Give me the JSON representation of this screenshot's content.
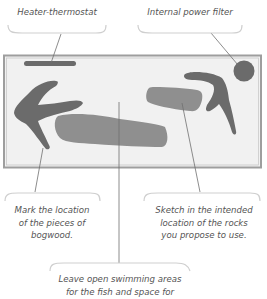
{
  "diagram": {
    "colors": {
      "tank_frame": "#9e9e9e",
      "tank_fill": "#f1f1f1",
      "bogwood": "#6b6b6b",
      "rock": "#8f8f8f",
      "heater": "#6b6b6b",
      "filter": "#6b6b6b",
      "leader_line": "#707070",
      "callout_curve": "#cfcfcf",
      "text": "#555555"
    },
    "callouts": {
      "heater": {
        "label": "Heater-thermostat"
      },
      "filter": {
        "label": "Internal power filter"
      },
      "bogwood": {
        "lines": [
          "Mark the location",
          "of the pieces of",
          "bogwood."
        ]
      },
      "rocks": {
        "lines": [
          "Sketch in the intended",
          "location of the rocks",
          "you propose to use."
        ]
      },
      "swimming": {
        "lines": [
          "Leave open swimming areas",
          "for the fish and space for"
        ]
      }
    }
  }
}
